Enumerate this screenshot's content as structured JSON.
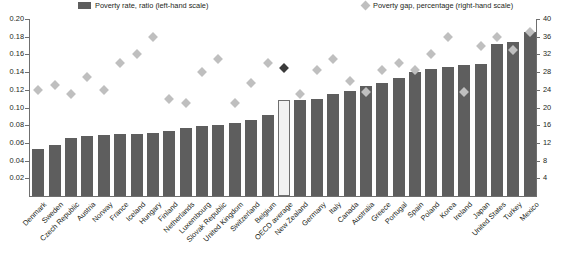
{
  "legend": {
    "bar_label": "Poverty rate, ratio (left-hand scale)",
    "diamond_label": "Poverty gap, percentage (right-hand scale)",
    "bar_color": "#5e5e5e",
    "diamond_color": "#bfbfbf",
    "highlight_color": "#3a3a3a"
  },
  "chart_data": {
    "type": "bar",
    "title": "",
    "xlabel": "",
    "ylabel": "",
    "grid": false,
    "legend_position": "top",
    "categories": [
      "Denmark",
      "Sweden",
      "Czech Republic",
      "Austria",
      "Norway",
      "France",
      "Iceland",
      "Hungary",
      "Finland",
      "Netherlands",
      "Luxembourg",
      "Slovak Republic",
      "United Kingdom",
      "Switzerland",
      "Belgium",
      "OECD average",
      "New Zealand",
      "Germany",
      "Italy",
      "Canada",
      "Australia",
      "Greece",
      "Portugal",
      "Spain",
      "Poland",
      "Korea",
      "Ireland",
      "Japan",
      "United States",
      "Turkey",
      "Mexico"
    ],
    "highlight_category": "OECD average",
    "left_axis": {
      "label": "Poverty rate, ratio (left-hand scale)",
      "ylim": [
        0,
        0.2
      ],
      "ticks": [
        0.2,
        0.18,
        0.16,
        0.14,
        0.12,
        0.1,
        0.08,
        0.06,
        0.04,
        0.02
      ],
      "tick_labels": [
        "0.20",
        "0.18",
        "0.16",
        "0.14",
        "0.12",
        "0.10",
        "0.08",
        "0.06",
        "0.04",
        "0.02"
      ]
    },
    "right_axis": {
      "label": "Poverty gap, percentage (right-hand scale)",
      "ylim": [
        0,
        40
      ],
      "ticks": [
        40,
        36,
        32,
        28,
        24,
        20,
        16,
        12,
        8,
        4
      ],
      "tick_labels": [
        "40",
        "36",
        "32",
        "28",
        "24",
        "20",
        "16",
        "12",
        "8",
        "4"
      ]
    },
    "series": [
      {
        "name": "Poverty rate, ratio (left-hand scale)",
        "axis": "left",
        "type": "bar",
        "values": [
          0.053,
          0.058,
          0.066,
          0.068,
          0.069,
          0.07,
          0.07,
          0.071,
          0.073,
          0.077,
          0.079,
          0.08,
          0.082,
          0.086,
          0.092,
          0.108,
          0.109,
          0.11,
          0.115,
          0.119,
          0.124,
          0.128,
          0.133,
          0.14,
          0.144,
          0.146,
          0.148,
          0.149,
          0.172,
          0.174,
          0.185
        ]
      },
      {
        "name": "Poverty gap, percentage (right-hand scale)",
        "axis": "right",
        "type": "scatter",
        "values": [
          24.0,
          25.0,
          23.0,
          27.0,
          24.0,
          30.0,
          32.0,
          36.0,
          22.0,
          21.0,
          28.0,
          31.0,
          21.0,
          25.5,
          30.0,
          29.0,
          23.0,
          28.5,
          31.0,
          26.0,
          23.5,
          28.5,
          30.0,
          28.5,
          32.0,
          36.0,
          23.5,
          34.0,
          36.0,
          33.0,
          37.0
        ]
      }
    ]
  }
}
